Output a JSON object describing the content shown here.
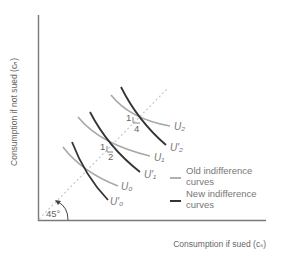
{
  "diagram": {
    "y_axis_label": "Consumption if not sued (cₙ)",
    "x_axis_label": "Consumption if sued (cₛ)",
    "angle_label": "45°",
    "curves": {
      "old": [
        {
          "label": "U₀",
          "id": "U0"
        },
        {
          "label": "U₁",
          "id": "U1"
        },
        {
          "label": "U₂",
          "id": "U2"
        }
      ],
      "new": [
        {
          "label": "U′₀",
          "id": "U0prime"
        },
        {
          "label": "U′₁",
          "id": "U1prime"
        },
        {
          "label": "U′₂",
          "id": "U2prime"
        }
      ]
    },
    "slope_markers": [
      {
        "rise": "1",
        "run": "2"
      },
      {
        "rise": "1",
        "run": "4"
      }
    ],
    "legend": {
      "old_line1": "Old indifference",
      "old_line2": "curves",
      "new_line1": "New indifference",
      "new_line2": "curves"
    },
    "colors": {
      "old_curve": "#a8a8a8",
      "new_curve": "#333333",
      "axis": "#7a7a7a",
      "diagonal": "#c8c8c8"
    }
  }
}
